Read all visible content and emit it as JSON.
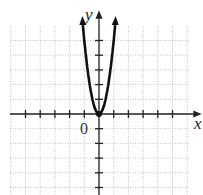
{
  "chart_data": {
    "type": "line",
    "title": "",
    "xlabel": "x",
    "ylabel": "y",
    "origin_label": "0",
    "xlim": [
      -6,
      6
    ],
    "ylim": [
      -5,
      6
    ],
    "grid": true,
    "x_ticks": [
      -5,
      -4,
      -3,
      -2,
      -1,
      1,
      2,
      3,
      4,
      5
    ],
    "y_ticks": [
      -5,
      -4,
      -3,
      -2,
      -1,
      1,
      2,
      3,
      4,
      5
    ],
    "series": [
      {
        "name": "parabola",
        "equation": "y = 5x^2",
        "x": [
          -1.1,
          -1,
          -0.75,
          -0.5,
          -0.25,
          0,
          0.25,
          0.5,
          0.75,
          1,
          1.1
        ],
        "y": [
          6.05,
          5,
          2.81,
          1.25,
          0.31,
          0,
          0.31,
          1.25,
          2.81,
          5,
          6.05
        ]
      }
    ]
  }
}
